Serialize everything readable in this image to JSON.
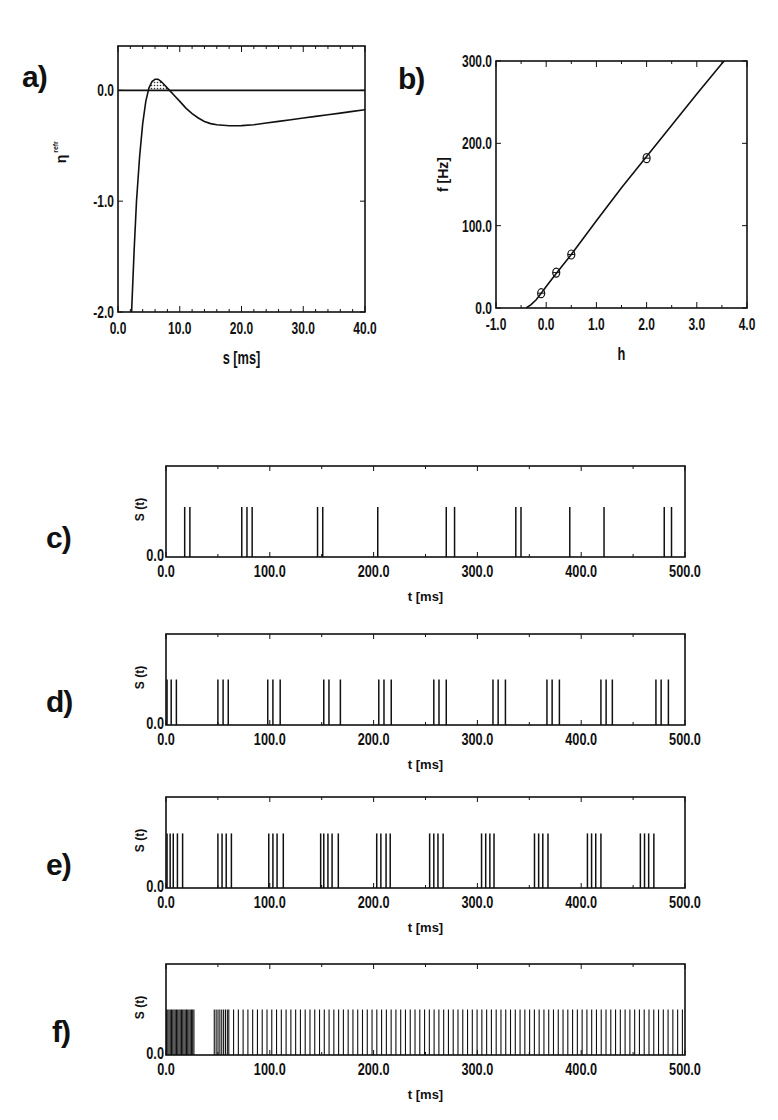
{
  "figure": {
    "panel_labels": [
      "a)",
      "b)",
      "c)",
      "d)",
      "e)",
      "f)"
    ]
  },
  "chart_data": [
    {
      "id": "a",
      "type": "line",
      "title": "",
      "xlabel": "s [ms]",
      "ylabel": "η^refr",
      "xlim": [
        0,
        40
      ],
      "ylim": [
        -2,
        0.4
      ],
      "xticks": [
        0,
        10,
        20,
        30,
        40
      ],
      "xtick_labels": [
        "0.0",
        "10.0",
        "20.0",
        "30.0",
        "40.0"
      ],
      "yticks": [
        -2,
        -1,
        0
      ],
      "ytick_labels": [
        "-2.0",
        "-1.0",
        "0.0"
      ],
      "hline": 0,
      "shaded_region": {
        "x_from": 5.0,
        "x_to": 8.8,
        "pattern": "hatched",
        "note": "area of curve above zero"
      },
      "series": [
        {
          "name": "eta",
          "x": [
            2.2,
            2.6,
            3.0,
            3.5,
            4.0,
            4.5,
            5.0,
            5.5,
            6.0,
            6.5,
            7.0,
            7.5,
            8.0,
            8.5,
            9.0,
            10.0,
            11.0,
            12.0,
            13.0,
            14.0,
            15.0,
            16.0,
            17.0,
            18.0,
            19.0,
            20.0,
            22.0,
            24.0,
            26.0,
            28.0,
            30.0,
            32.0,
            34.0,
            36.0,
            38.0,
            40.0
          ],
          "y": [
            -2.0,
            -1.45,
            -1.0,
            -0.6,
            -0.3,
            -0.1,
            0.02,
            0.08,
            0.1,
            0.1,
            0.08,
            0.05,
            0.02,
            -0.01,
            -0.04,
            -0.1,
            -0.16,
            -0.21,
            -0.25,
            -0.28,
            -0.3,
            -0.31,
            -0.315,
            -0.32,
            -0.32,
            -0.318,
            -0.31,
            -0.295,
            -0.28,
            -0.265,
            -0.25,
            -0.235,
            -0.22,
            -0.205,
            -0.19,
            -0.175
          ]
        }
      ]
    },
    {
      "id": "b",
      "type": "line",
      "title": "",
      "xlabel": "h",
      "ylabel": "f [Hz]",
      "xlim": [
        -1,
        4
      ],
      "ylim": [
        0,
        300
      ],
      "xticks": [
        -1,
        0,
        1,
        2,
        3,
        4
      ],
      "xtick_labels": [
        "-1.0",
        "0.0",
        "1.0",
        "2.0",
        "3.0",
        "4.0"
      ],
      "yticks": [
        0,
        100,
        200,
        300
      ],
      "ytick_labels": [
        "0.0",
        "100.0",
        "200.0",
        "300.0"
      ],
      "series": [
        {
          "name": "gain function",
          "x": [
            -0.4,
            -0.3,
            -0.2,
            -0.1,
            0.0,
            0.2,
            0.5,
            1.0,
            1.5,
            2.0,
            2.5,
            3.0,
            3.5,
            3.55
          ],
          "y": [
            0,
            4,
            10,
            18,
            26,
            42,
            65,
            106,
            146,
            184,
            222,
            260,
            297,
            300
          ]
        },
        {
          "name": "simulation markers",
          "marker": "circle-cross",
          "x": [
            -0.1,
            0.2,
            0.5,
            2.0
          ],
          "y": [
            18,
            43,
            65,
            182
          ]
        }
      ]
    },
    {
      "id": "c",
      "type": "spike_train",
      "xlabel": "t  [ms]",
      "ylabel": "S (t)",
      "xlim": [
        0,
        500
      ],
      "xticks": [
        0,
        100,
        200,
        300,
        400,
        500
      ],
      "xtick_labels": [
        "0.0",
        "100.0",
        "200.0",
        "300.0",
        "400.0",
        "500.0"
      ],
      "ytick_labels": [
        "0.0"
      ],
      "spike_height": 0.55,
      "spikes": [
        18,
        23,
        73,
        78,
        83,
        146,
        151,
        204,
        270,
        278,
        337,
        342,
        389,
        422,
        480,
        487
      ]
    },
    {
      "id": "d",
      "type": "spike_train",
      "xlabel": "t  [ms]",
      "ylabel": "S (t)",
      "xlim": [
        0,
        500
      ],
      "xticks": [
        0,
        100,
        200,
        300,
        400,
        500
      ],
      "xtick_labels": [
        "0.0",
        "100.0",
        "200.0",
        "300.0",
        "400.0",
        "500.0"
      ],
      "ytick_labels": [
        "0.0"
      ],
      "spike_height": 0.5,
      "spikes": [
        1,
        5,
        10,
        50,
        55,
        60,
        98,
        103,
        110,
        152,
        157,
        168,
        205,
        210,
        217,
        258,
        263,
        270,
        315,
        320,
        327,
        367,
        372,
        379,
        419,
        424,
        430,
        472,
        477,
        484
      ]
    },
    {
      "id": "e",
      "type": "spike_train",
      "xlabel": "t  [ms]",
      "ylabel": "S (t)",
      "xlim": [
        0,
        500
      ],
      "xticks": [
        0,
        100,
        200,
        300,
        400,
        500
      ],
      "xtick_labels": [
        "0.0",
        "100.0",
        "200.0",
        "300.0",
        "400.0",
        "500.0"
      ],
      "ytick_labels": [
        "0.0"
      ],
      "spike_height": 0.6,
      "spikes": [
        1,
        4,
        7,
        11,
        16,
        50,
        54,
        58,
        63,
        99,
        103,
        107,
        113,
        149,
        152,
        156,
        160,
        166,
        203,
        207,
        212,
        216,
        254,
        258,
        262,
        267,
        304,
        308,
        312,
        316,
        355,
        359,
        363,
        368,
        406,
        410,
        414,
        419,
        457,
        461,
        465,
        470
      ]
    },
    {
      "id": "f",
      "type": "spike_train",
      "xlabel": "t  [ms]",
      "ylabel": "S (t)",
      "xlim": [
        0,
        500
      ],
      "xticks": [
        0,
        100,
        200,
        300,
        400,
        500
      ],
      "xtick_labels": [
        "0.0",
        "100.0",
        "200.0",
        "300.0",
        "400.0",
        "500.0"
      ],
      "ytick_labels": [
        "0.0"
      ],
      "spike_height": 0.5,
      "dense_bursts": [
        {
          "from": 0,
          "to": 27,
          "interval": 1.2
        },
        {
          "from": 46,
          "to": 60,
          "interval": 1.8
        },
        {
          "from": 60,
          "to": 500,
          "interval": 4.6
        }
      ]
    }
  ]
}
